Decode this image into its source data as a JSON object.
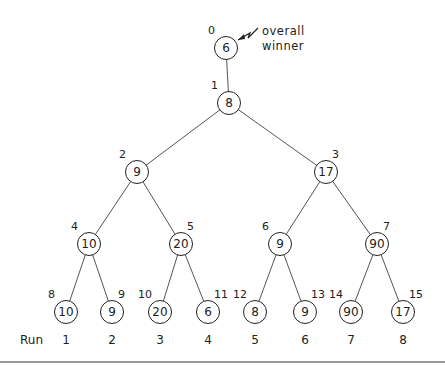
{
  "diagram": {
    "type": "tournament-tree",
    "annotation": {
      "line1": "overall",
      "line2": "winner"
    },
    "run_title": "Run",
    "nodes": [
      {
        "index": "0",
        "value": "6",
        "x": 226,
        "y": 48
      },
      {
        "index": "1",
        "value": "8",
        "x": 229,
        "y": 103
      },
      {
        "index": "2",
        "value": "9",
        "x": 137,
        "y": 172
      },
      {
        "index": "3",
        "value": "17",
        "x": 326,
        "y": 172
      },
      {
        "index": "4",
        "value": "10",
        "x": 89,
        "y": 244
      },
      {
        "index": "5",
        "value": "20",
        "x": 181,
        "y": 244
      },
      {
        "index": "6",
        "value": "9",
        "x": 280,
        "y": 244
      },
      {
        "index": "7",
        "value": "90",
        "x": 377,
        "y": 244
      },
      {
        "index": "8",
        "value": "10",
        "x": 66,
        "y": 312
      },
      {
        "index": "9",
        "value": "9",
        "x": 112,
        "y": 312
      },
      {
        "index": "10",
        "value": "20",
        "x": 160,
        "y": 312
      },
      {
        "index": "11",
        "value": "6",
        "x": 208,
        "y": 312
      },
      {
        "index": "12",
        "value": "8",
        "x": 255,
        "y": 312
      },
      {
        "index": "13",
        "value": "9",
        "x": 305,
        "y": 312
      },
      {
        "index": "14",
        "value": "90",
        "x": 351,
        "y": 312
      },
      {
        "index": "15",
        "value": "17",
        "x": 403,
        "y": 312
      }
    ],
    "runs": [
      "1",
      "2",
      "3",
      "4",
      "5",
      "6",
      "7",
      "8"
    ],
    "edges": [
      [
        0,
        1
      ],
      [
        1,
        2
      ],
      [
        1,
        3
      ],
      [
        2,
        4
      ],
      [
        2,
        5
      ],
      [
        3,
        6
      ],
      [
        3,
        7
      ],
      [
        4,
        8
      ],
      [
        4,
        9
      ],
      [
        5,
        10
      ],
      [
        5,
        11
      ],
      [
        6,
        12
      ],
      [
        6,
        13
      ],
      [
        7,
        14
      ],
      [
        7,
        15
      ]
    ]
  }
}
